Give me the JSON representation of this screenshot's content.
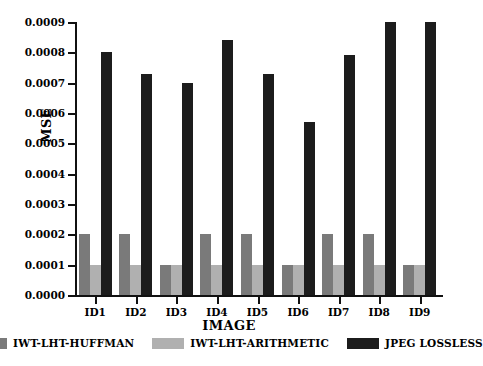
{
  "chart_data": {
    "type": "bar",
    "title": "",
    "xlabel": "IMAGE",
    "ylabel": "MSE",
    "categories": [
      "ID1",
      "ID2",
      "ID3",
      "ID4",
      "ID5",
      "ID6",
      "ID7",
      "ID8",
      "ID9"
    ],
    "ylim": [
      0.0,
      0.0009
    ],
    "ytick_labels": [
      "0.0000",
      "0.0001",
      "0.0002",
      "0.0003",
      "0.0004",
      "0.0005",
      "0.0006",
      "0.0007",
      "0.0008",
      "0.0009"
    ],
    "ytick_values": [
      0.0,
      0.0001,
      0.0002,
      0.0003,
      0.0004,
      0.0005,
      0.0006,
      0.0007,
      0.0008,
      0.0009
    ],
    "grid": false,
    "legend_position": "bottom",
    "series": [
      {
        "name": "IWT-LHT-HUFFMAN",
        "color": "#7a7a7a",
        "values": [
          0.0002,
          0.0002,
          0.0001,
          0.0002,
          0.0002,
          0.0001,
          0.0002,
          0.0002,
          0.0001
        ]
      },
      {
        "name": "IWT-LHT-ARITHMETIC",
        "color": "#b0b0b0",
        "values": [
          0.0001,
          0.0001,
          0.0001,
          0.0001,
          0.0001,
          0.0001,
          0.0001,
          0.0001,
          0.0001
        ]
      },
      {
        "name": "JPEG LOSSLESS",
        "color": "#1c1c1c",
        "values": [
          0.0008,
          0.00073,
          0.0007,
          0.00084,
          0.00073,
          0.00057,
          0.00079,
          0.0009,
          0.0009
        ]
      }
    ]
  }
}
